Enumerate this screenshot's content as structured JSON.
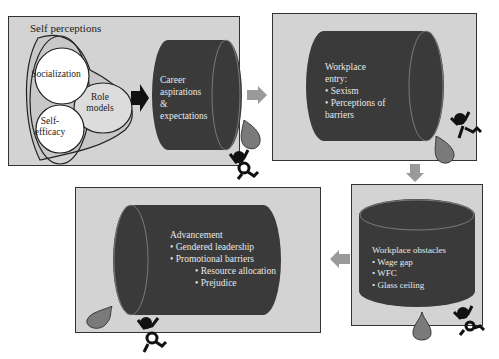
{
  "colors": {
    "panel_bg": "#d3d3d3",
    "panel_border": "#333333",
    "cylinder": "#3a3a3a",
    "cylinder_text": "#e8e8e8",
    "arrow_gray": "#9a9a9a",
    "drop": "#7a7a7a"
  },
  "panel1": {
    "title": "Self perceptions",
    "circles": {
      "socialization": "Socialization",
      "role_models_line1": "Role",
      "role_models_line2": "models",
      "self_efficacy_line1": "Self-",
      "self_efficacy_line2": "efficacy"
    },
    "cylinder": {
      "lines": [
        "Career",
        "aspirations",
        "&",
        "expectations"
      ]
    }
  },
  "panel2": {
    "cylinder": {
      "lines": [
        "Workplace",
        "entry:",
        "• Sexism",
        "• Perceptions of",
        "barriers"
      ]
    }
  },
  "panel3": {
    "cylinder": {
      "lines": [
        "Workplace obstacles",
        "• Wage gap",
        "• WFC",
        "• Glass ceiling"
      ]
    }
  },
  "panel4": {
    "cylinder": {
      "lines": [
        "Advancement",
        "• Gendered leadership",
        "• Promotional barriers",
        "• Resource allocation",
        "• Prejudice"
      ]
    }
  },
  "icons": [
    "black-arrow-right",
    "gray-arrow-right",
    "gray-arrow-down",
    "gray-arrow-left",
    "water-drop",
    "struggling-figure"
  ]
}
